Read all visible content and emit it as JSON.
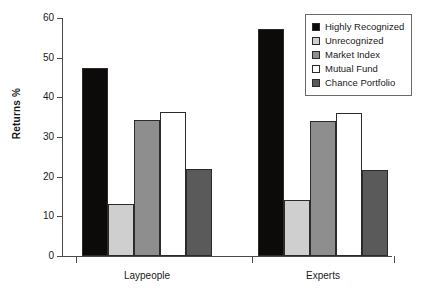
{
  "chart_data": {
    "type": "bar",
    "title": "",
    "xlabel": "",
    "ylabel": "Returns %",
    "ylim": [
      0,
      60
    ],
    "yticks": [
      0,
      10,
      20,
      30,
      40,
      50,
      60
    ],
    "grid": false,
    "legend_position": "top-right",
    "categories": [
      "Laypeople",
      "Experts"
    ],
    "series": [
      {
        "name": "Highly Recognized",
        "color": "#0d0b0a",
        "values": [
          47.5,
          57.3
        ]
      },
      {
        "name": "Unrecognized",
        "color": "#cfcfcf",
        "values": [
          13.0,
          14.0
        ]
      },
      {
        "name": "Market Index",
        "color": "#8e8e8e",
        "values": [
          34.2,
          34.1
        ]
      },
      {
        "name": "Mutual Fund",
        "color": "#ffffff",
        "values": [
          36.2,
          36.1
        ]
      },
      {
        "name": "Chance Portfolio",
        "color": "#5a5a5a",
        "values": [
          22.0,
          21.8
        ]
      }
    ]
  }
}
